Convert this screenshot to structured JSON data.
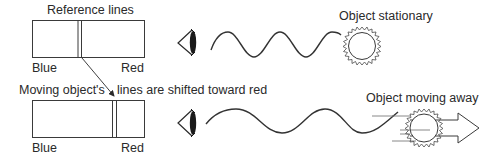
{
  "diagram": {
    "type": "redshift-doppler",
    "top_panel": {
      "spectrum_title": "Reference lines",
      "left_label": "Blue",
      "right_label": "Red",
      "object_label": "Object stationary"
    },
    "bottom_panel": {
      "caption_left": "Moving object's",
      "caption_right": "lines are shifted toward red",
      "left_label": "Blue",
      "right_label": "Red",
      "object_label": "Object moving away"
    },
    "icons": [
      "eye-icon",
      "wave",
      "star-icon",
      "arrow-right-icon"
    ],
    "colors": {
      "ink": "#2a2a2a",
      "background": "#ffffff"
    }
  }
}
